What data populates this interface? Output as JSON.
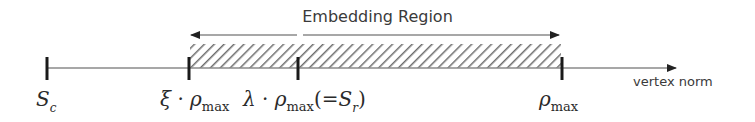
{
  "title": "Embedding Region",
  "axis": {
    "label": "vertex norm",
    "color": "#555555"
  },
  "ticks": [
    {
      "id": "s-c",
      "symbol": "S",
      "subscript": "c",
      "x": 47
    },
    {
      "id": "xi-rho-max",
      "prefix": "ξ",
      "dot": "·",
      "symbol": "ρ",
      "subscript": "max",
      "x": 189
    },
    {
      "id": "lambda-rho-max",
      "prefix": "λ",
      "dot": "·",
      "symbol": "ρ",
      "subscript": "max",
      "suffix_open": "(=",
      "suffix_symbol": "S",
      "suffix_subscript": "r",
      "suffix_close": ")",
      "x": 298
    },
    {
      "id": "rho-max",
      "symbol": "ρ",
      "subscript": "max",
      "x": 562
    }
  ],
  "region": {
    "from_tick": "ξ·ρmax",
    "to_tick": "ρmax",
    "pattern": "diagonal-hatch",
    "hatch_color": "#6a6a6a"
  },
  "colors": {
    "tick": "#1a1a1a",
    "line": "#8a8a8a",
    "text": "#333333"
  }
}
